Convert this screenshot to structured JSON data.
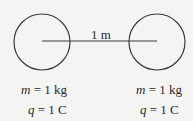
{
  "diagram": {
    "separation_label": "1 m",
    "spheres": [
      {
        "name": "left-sphere",
        "mass_symbol": "m",
        "mass_value": "= 1 kg",
        "charge_symbol": "q",
        "charge_value": "= 1 C"
      },
      {
        "name": "right-sphere",
        "mass_symbol": "m",
        "mass_value": "= 1 kg",
        "charge_symbol": "q",
        "charge_value": "= 1 C"
      }
    ],
    "colors": {
      "stroke": "#3a3a3a",
      "background": "#f4f4f2",
      "text": "#2a2a2a"
    }
  }
}
